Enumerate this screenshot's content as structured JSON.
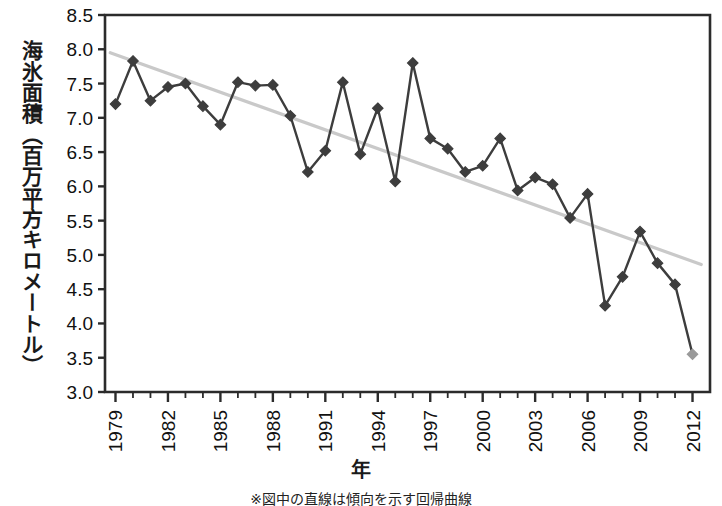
{
  "chart_data": {
    "type": "line",
    "title": "",
    "xlabel": "年",
    "ylabel": "海氷面積（百万平方キロメートル）",
    "footnote": "※図中の直線は傾向を示す回帰曲線",
    "xlim": [
      1978.4,
      2013.0
    ],
    "ylim": [
      3.0,
      8.5
    ],
    "y_ticks": [
      "8.5",
      "8.0",
      "7.5",
      "7.0",
      "6.5",
      "6.0",
      "5.5",
      "5.0",
      "4.5",
      "4.0",
      "3.5",
      "3.0"
    ],
    "y_tick_values": [
      8.5,
      8.0,
      7.5,
      7.0,
      6.5,
      6.0,
      5.5,
      5.0,
      4.5,
      4.0,
      3.5,
      3.0
    ],
    "x_tick_labels": [
      "1979",
      "1982",
      "1985",
      "1988",
      "1991",
      "1994",
      "1997",
      "2000",
      "2003",
      "2006",
      "2009",
      "2012"
    ],
    "x_tick_values": [
      1979,
      1982,
      1985,
      1988,
      1991,
      1994,
      1997,
      2000,
      2003,
      2006,
      2009,
      2012
    ],
    "x_minor_values": [
      1980,
      1981,
      1983,
      1984,
      1986,
      1987,
      1989,
      1990,
      1992,
      1993,
      1995,
      1996,
      1998,
      1999,
      2001,
      2002,
      2004,
      2005,
      2007,
      2008,
      2010,
      2011
    ],
    "grid": false,
    "legend": "none",
    "marker": "diamond",
    "series": [
      {
        "name": "海氷面積",
        "color": "#3d3d3d",
        "x": [
          1979,
          1980,
          1981,
          1982,
          1983,
          1984,
          1985,
          1986,
          1987,
          1988,
          1989,
          1990,
          1991,
          1992,
          1993,
          1994,
          1995,
          1996,
          1997,
          1998,
          1999,
          2000,
          2001,
          2002,
          2003,
          2004,
          2005,
          2006,
          2007,
          2008,
          2009,
          2010,
          2011,
          2012
        ],
        "values": [
          7.2,
          7.83,
          7.25,
          7.45,
          7.5,
          7.17,
          6.9,
          7.52,
          7.47,
          7.48,
          7.03,
          6.21,
          6.52,
          7.52,
          6.47,
          7.14,
          6.07,
          7.8,
          6.7,
          6.55,
          6.21,
          6.3,
          6.7,
          5.94,
          6.13,
          6.03,
          5.54,
          5.89,
          4.26,
          4.68,
          5.34,
          4.88,
          4.57,
          3.55
        ]
      }
    ],
    "trendline": {
      "name": "回帰曲線",
      "color": "#c9c9c9",
      "x": [
        1978.7,
        2012.5
      ],
      "y": [
        7.95,
        4.86
      ]
    },
    "last_point_color": "#9a9a9a"
  },
  "axes": {
    "plot_left_px": 105,
    "plot_right_px": 710,
    "plot_top_px": 15,
    "plot_bottom_px": 392
  }
}
